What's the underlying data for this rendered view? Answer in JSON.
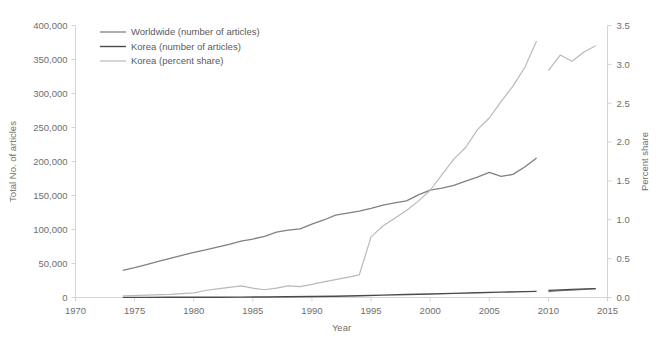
{
  "chart_data": {
    "type": "line",
    "title": "",
    "xlabel": "Year",
    "ylabel": "Total No. of articles",
    "y2label": "Percent share",
    "xlim": [
      1970,
      2015
    ],
    "ylim": [
      0,
      400000
    ],
    "y2lim": [
      0.0,
      3.5
    ],
    "grid": false,
    "legend_position": "top-left",
    "x_ticks": [
      "1970",
      "1975",
      "1980",
      "1985",
      "1990",
      "1995",
      "2000",
      "2005",
      "2010",
      "2015"
    ],
    "y_ticks": [
      "0",
      "50,000",
      "100,000",
      "150,000",
      "200,000",
      "250,000",
      "300,000",
      "350,000",
      "400,000"
    ],
    "y2_ticks": [
      "0.0",
      "0.5",
      "1.0",
      "1.5",
      "2.0",
      "2.5",
      "3.0",
      "3.5"
    ],
    "series": [
      {
        "name": "Worldwide (number of articles)",
        "axis": "left",
        "color": "#808080",
        "width": 1.3,
        "segments": [
          {
            "x": [
              1974,
              1975,
              1976,
              1977,
              1978,
              1979,
              1980,
              1981,
              1982,
              1983,
              1984,
              1985,
              1986,
              1987,
              1988,
              1989,
              1990,
              1991,
              1992,
              1993,
              1994,
              1995,
              1996,
              1997,
              1998,
              1999,
              2000,
              2001,
              2002,
              2003,
              2004,
              2005,
              2006,
              2007,
              2008,
              2009
            ],
            "y": [
              40000,
              44000,
              48500,
              53000,
              57500,
              62000,
              66500,
              70000,
              74000,
              78000,
              83000,
              86000,
              90000,
              96000,
              99000,
              101000,
              108000,
              114000,
              121000,
              124000,
              127000,
              131000,
              136000,
              139000,
              142000,
              151000,
              158000,
              161000,
              165000,
              171000,
              177000,
              184000,
              178000,
              181000,
              192000,
              205000
            ]
          },
          {
            "x": [
              2010,
              2011,
              2012,
              2013,
              2014
            ],
            "y": [
              8500,
              10000,
              11000,
              12000,
              13000
            ]
          }
        ]
      },
      {
        "name": "Korea (number of articles)",
        "axis": "left",
        "color": "#4a4a4a",
        "width": 1.4,
        "segments": [
          {
            "x": [
              1974,
              1976,
              1978,
              1980,
              1982,
              1984,
              1986,
              1988,
              1990,
              1992,
              1994,
              1996,
              1998,
              2000,
              2002,
              2004,
              2006,
              2008,
              2009
            ],
            "y": [
              150,
              200,
              260,
              340,
              450,
              600,
              800,
              1050,
              1400,
              1900,
              2600,
              3500,
              4400,
              5200,
              6100,
              7000,
              7900,
              8600,
              9000
            ]
          },
          {
            "x": [
              2010,
              2012,
              2014
            ],
            "y": [
              10500,
              12000,
              13000
            ]
          }
        ]
      },
      {
        "name": "Korea (percent share)",
        "axis": "right",
        "color": "#b9b9b9",
        "width": 1.2,
        "segments": [
          {
            "x": [
              1974,
              1976,
              1978,
              1980,
              1981,
              1982,
              1983,
              1984,
              1985,
              1986,
              1987,
              1988,
              1989,
              1990,
              1991,
              1992,
              1993,
              1994,
              1995,
              1996,
              1997,
              1998,
              1999,
              2000,
              2001,
              2002,
              2003,
              2004,
              2005,
              2006,
              2007,
              2008,
              2009
            ],
            "y": [
              0.02,
              0.03,
              0.04,
              0.06,
              0.09,
              0.11,
              0.13,
              0.15,
              0.12,
              0.1,
              0.12,
              0.15,
              0.14,
              0.17,
              0.2,
              0.23,
              0.26,
              0.29,
              0.78,
              0.92,
              1.02,
              1.12,
              1.24,
              1.38,
              1.58,
              1.78,
              1.93,
              2.16,
              2.31,
              2.52,
              2.72,
              2.96,
              3.3
            ]
          },
          {
            "x": [
              2010,
              2011,
              2012,
              2013,
              2014
            ],
            "y": [
              2.92,
              3.12,
              3.04,
              3.16,
              3.24
            ]
          }
        ]
      }
    ]
  },
  "legend": {
    "items": [
      {
        "label": "Worldwide (number of articles)",
        "color": "#808080"
      },
      {
        "label": "Korea (number of articles)",
        "color": "#4a4a4a"
      },
      {
        "label": "Korea (percent share)",
        "color": "#b9b9b9"
      }
    ]
  }
}
